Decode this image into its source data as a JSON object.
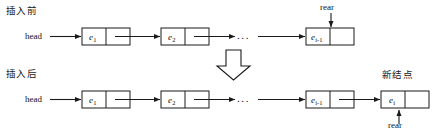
{
  "diagram": {
    "title_before": "插入前",
    "title_after": "插入后",
    "new_node_label": "新结点",
    "head_label": "head",
    "rear_label": "rear",
    "ellipsis": "...",
    "transition_icon": "down-block-arrow",
    "rows": [
      {
        "id": "before",
        "caption": "插入前",
        "head": "head",
        "nodes": [
          {
            "value": "e",
            "sub": "1"
          },
          {
            "value": "e",
            "sub": "2"
          },
          {
            "value": "e",
            "sub": "i-1"
          }
        ],
        "ellipsis": "...",
        "pointer": {
          "label": "rear",
          "target": "e i-1",
          "direction": "down"
        }
      },
      {
        "id": "after",
        "caption": "插入后",
        "head": "head",
        "nodes": [
          {
            "value": "e",
            "sub": "1"
          },
          {
            "value": "e",
            "sub": "2"
          },
          {
            "value": "e",
            "sub": "i-1"
          },
          {
            "value": "e",
            "sub": "i"
          }
        ],
        "ellipsis": "...",
        "new_node": {
          "value": "e",
          "sub": "i",
          "caption": "新结点"
        },
        "pointer": {
          "label": "rear",
          "target": "e i",
          "direction": "up"
        }
      }
    ],
    "colors": {
      "stroke": "#1a1a1a",
      "background": "#ffffff",
      "node_fill": "#ffffff"
    }
  }
}
